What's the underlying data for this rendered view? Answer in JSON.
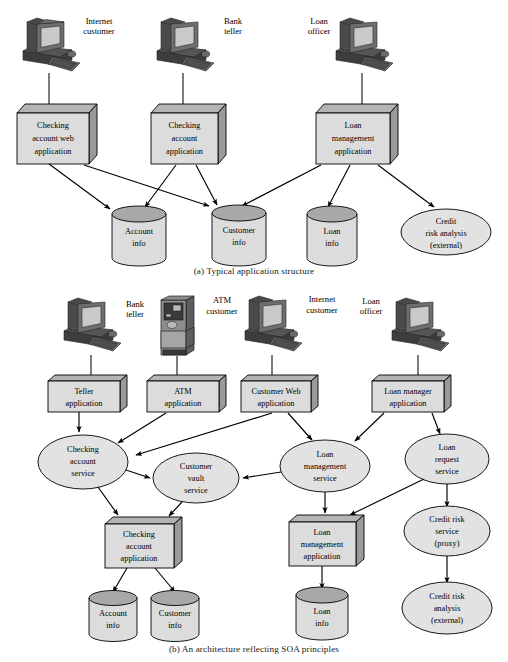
{
  "figure": {
    "caption_a": "(a) Typical application structure",
    "caption_b": "(b) An architecture reflecting SOA principles"
  },
  "colors": {
    "box_face": "#dcdcdc",
    "box_top": "#b4b4b4",
    "box_side": "#9a9a9a",
    "cylinder_body": "#dcdcdc",
    "cylinder_top": "#a8a8a8",
    "ellipse_fill": "#e2e2e2",
    "outline": "#000000",
    "background": "#ffffff",
    "monitor_dark": "#4a4a4a",
    "monitor_screen": "#c9c9c9"
  },
  "diagram_a": {
    "actors": [
      {
        "id": "a-actor-internet",
        "icon": "workstation-icon",
        "label_line1": "Internet",
        "label_line2": "customer"
      },
      {
        "id": "a-actor-teller",
        "icon": "workstation-icon",
        "label_line1": "Bank",
        "label_line2": "teller"
      },
      {
        "id": "a-actor-officer",
        "icon": "workstation-icon",
        "label_line1": "Loan",
        "label_line2": "officer"
      }
    ],
    "applications": [
      {
        "id": "a-app-checking-web",
        "lines": [
          "Checking",
          "account web",
          "application"
        ]
      },
      {
        "id": "a-app-checking",
        "lines": [
          "Checking",
          "account",
          "application"
        ]
      },
      {
        "id": "a-app-loan-management",
        "lines": [
          "Loan",
          "management",
          "application"
        ]
      }
    ],
    "datastores": [
      {
        "id": "a-db-account",
        "lines": [
          "Account",
          "info"
        ]
      },
      {
        "id": "a-db-customer",
        "lines": [
          "Customer",
          "info"
        ]
      },
      {
        "id": "a-db-loan",
        "lines": [
          "Loan",
          "info"
        ]
      }
    ],
    "externals": [
      {
        "id": "a-ext-credit-risk",
        "lines": [
          "Credit",
          "risk analysis",
          "(external)"
        ]
      }
    ],
    "connections": [
      {
        "from": "a-actor-internet",
        "to": "a-app-checking-web",
        "arrow": false
      },
      {
        "from": "a-actor-teller",
        "to": "a-app-checking",
        "arrow": false
      },
      {
        "from": "a-actor-officer",
        "to": "a-app-loan-management",
        "arrow": false
      },
      {
        "from": "a-app-checking-web",
        "to": "a-db-account",
        "arrow": true
      },
      {
        "from": "a-app-checking-web",
        "to": "a-db-customer",
        "arrow": true
      },
      {
        "from": "a-app-checking",
        "to": "a-db-account",
        "arrow": true
      },
      {
        "from": "a-app-checking",
        "to": "a-db-customer",
        "arrow": true
      },
      {
        "from": "a-app-loan-management",
        "to": "a-db-customer",
        "arrow": true
      },
      {
        "from": "a-app-loan-management",
        "to": "a-db-loan",
        "arrow": true
      },
      {
        "from": "a-app-loan-management",
        "to": "a-ext-credit-risk",
        "arrow": true
      }
    ]
  },
  "diagram_b": {
    "actors": [
      {
        "id": "b-actor-teller",
        "icon": "workstation-icon",
        "label_line1": "Bank",
        "label_line2": "teller"
      },
      {
        "id": "b-actor-atm",
        "icon": "atm-icon",
        "label_line1": "ATM",
        "label_line2": "customer"
      },
      {
        "id": "b-actor-internet",
        "icon": "workstation-icon",
        "label_line1": "Internet",
        "label_line2": "customer"
      },
      {
        "id": "b-actor-officer",
        "icon": "workstation-icon",
        "label_line1": "Loan",
        "label_line2": "officer"
      }
    ],
    "applications": [
      {
        "id": "b-app-teller",
        "lines": [
          "Teller",
          "application"
        ]
      },
      {
        "id": "b-app-atm",
        "lines": [
          "ATM",
          "application"
        ]
      },
      {
        "id": "b-app-customer-web",
        "lines": [
          "Customer Web",
          "application"
        ]
      },
      {
        "id": "b-app-loan-manager",
        "lines": [
          "Loan manager",
          "application"
        ]
      }
    ],
    "services": [
      {
        "id": "b-svc-checking",
        "lines": [
          "Checking",
          "account",
          "service"
        ]
      },
      {
        "id": "b-svc-customer-vault",
        "lines": [
          "Customer",
          "vault",
          "service"
        ]
      },
      {
        "id": "b-svc-loan-mgmt",
        "lines": [
          "Loan",
          "management",
          "service"
        ]
      },
      {
        "id": "b-svc-loan-request",
        "lines": [
          "Loan",
          "request",
          "service"
        ]
      },
      {
        "id": "b-svc-credit-risk",
        "lines": [
          "Credit risk",
          "service",
          "(proxy)"
        ]
      }
    ],
    "externals": [
      {
        "id": "b-ext-credit-risk",
        "lines": [
          "Credit risk",
          "analysis",
          "(external)"
        ]
      }
    ],
    "back_applications": [
      {
        "id": "b-bapp-checking",
        "lines": [
          "Checking",
          "account",
          "application"
        ]
      },
      {
        "id": "b-bapp-loan",
        "lines": [
          "Loan",
          "management",
          "application"
        ]
      }
    ],
    "datastores": [
      {
        "id": "b-db-account",
        "lines": [
          "Account",
          "info"
        ]
      },
      {
        "id": "b-db-customer",
        "lines": [
          "Customer",
          "info"
        ]
      },
      {
        "id": "b-db-loan",
        "lines": [
          "Loan",
          "info"
        ]
      }
    ],
    "connections": [
      {
        "from": "b-actor-teller",
        "to": "b-app-teller",
        "arrow": false
      },
      {
        "from": "b-actor-atm",
        "to": "b-app-atm",
        "arrow": false
      },
      {
        "from": "b-actor-internet",
        "to": "b-app-customer-web",
        "arrow": false
      },
      {
        "from": "b-actor-officer",
        "to": "b-app-loan-manager",
        "arrow": false
      },
      {
        "from": "b-app-teller",
        "to": "b-svc-checking",
        "arrow": true
      },
      {
        "from": "b-app-atm",
        "to": "b-svc-checking",
        "arrow": true
      },
      {
        "from": "b-app-customer-web",
        "to": "b-svc-checking",
        "arrow": true
      },
      {
        "from": "b-app-customer-web",
        "to": "b-svc-loan-mgmt",
        "arrow": true
      },
      {
        "from": "b-app-loan-manager",
        "to": "b-svc-loan-mgmt",
        "arrow": true
      },
      {
        "from": "b-app-loan-manager",
        "to": "b-svc-loan-request",
        "arrow": true
      },
      {
        "from": "b-svc-checking",
        "to": "b-svc-customer-vault",
        "arrow": true
      },
      {
        "from": "b-svc-loan-mgmt",
        "to": "b-svc-customer-vault",
        "arrow": true
      },
      {
        "from": "b-svc-checking",
        "to": "b-bapp-checking",
        "arrow": true
      },
      {
        "from": "b-svc-customer-vault",
        "to": "b-bapp-checking",
        "arrow": true
      },
      {
        "from": "b-svc-loan-mgmt",
        "to": "b-bapp-loan",
        "arrow": true
      },
      {
        "from": "b-svc-loan-request",
        "to": "b-bapp-loan",
        "arrow": true
      },
      {
        "from": "b-svc-loan-request",
        "to": "b-svc-credit-risk",
        "arrow": true
      },
      {
        "from": "b-svc-credit-risk",
        "to": "b-ext-credit-risk",
        "arrow": true
      },
      {
        "from": "b-bapp-checking",
        "to": "b-db-account",
        "arrow": true
      },
      {
        "from": "b-bapp-checking",
        "to": "b-db-customer",
        "arrow": true
      },
      {
        "from": "b-bapp-loan",
        "to": "b-db-loan",
        "arrow": true
      }
    ]
  }
}
